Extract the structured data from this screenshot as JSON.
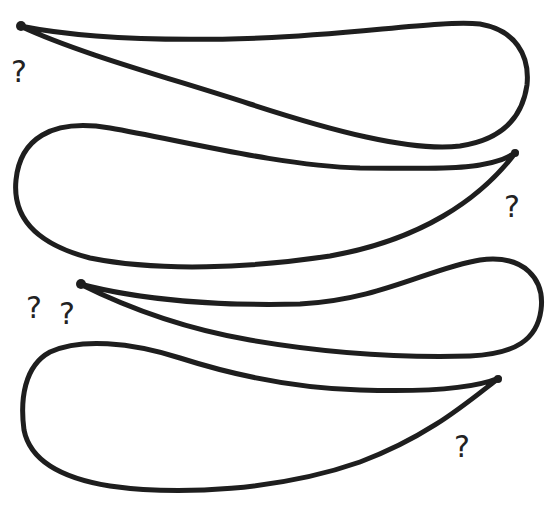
{
  "illustration": {
    "background": "#ffffff",
    "stroke_color": "#1e1e1e",
    "shapes": [
      {
        "name": "airfoil-1",
        "orientation": "tip-left",
        "tip": [
          20,
          26
        ]
      },
      {
        "name": "airfoil-2",
        "orientation": "tip-right",
        "tip": [
          516,
          152
        ]
      },
      {
        "name": "airfoil-3",
        "orientation": "tip-left",
        "tip": [
          80,
          284
        ]
      },
      {
        "name": "airfoil-4",
        "orientation": "tip-right",
        "tip": [
          499,
          378
        ]
      }
    ],
    "question_marks": [
      {
        "text": "?",
        "x": 19,
        "y": 72
      },
      {
        "text": "?",
        "x": 512,
        "y": 207
      },
      {
        "text": "?",
        "x": 34,
        "y": 308
      },
      {
        "text": "?",
        "x": 67,
        "y": 314
      },
      {
        "text": "?",
        "x": 462,
        "y": 447
      }
    ]
  }
}
